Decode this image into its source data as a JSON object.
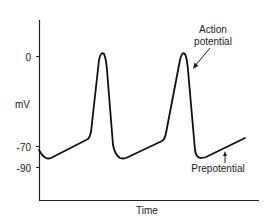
{
  "diagram": {
    "title": "",
    "y_axis": {
      "label": "mV",
      "ticks": [
        {
          "label": "0",
          "value": 0
        },
        {
          "label": "-70",
          "value": -70
        },
        {
          "label": "-90",
          "value": -90
        }
      ]
    },
    "x_axis": {
      "label": "Time"
    },
    "annotations": {
      "action_potential_line1": "Action",
      "action_potential_line2": "potential",
      "prepotential": "Prepotential"
    },
    "waveform": {
      "description": "Pacemaker action potentials with slow diastolic depolarization (prepotential)",
      "peaks": 2,
      "stroke_color": "#111111"
    }
  }
}
